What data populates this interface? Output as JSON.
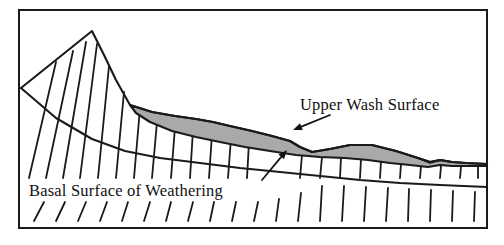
{
  "figure": {
    "name": "geological-cross-section",
    "background_color": "#ffffff",
    "frame": {
      "stroke_color": "#1a1a1a",
      "stroke_width": 2,
      "x": 19,
      "y": 10,
      "width": 468,
      "height": 218
    }
  },
  "labels": {
    "upper_wash_surface": {
      "text": "Upper Wash Surface",
      "x": 300,
      "y": 110,
      "anchor": "start",
      "color": "#111111"
    },
    "basal_surface_of_weathering": {
      "text": "Basal Surface of Weathering",
      "x": 29,
      "y": 196,
      "anchor": "start",
      "color": "#111111"
    }
  },
  "leader_arrows": [
    {
      "name": "upper-wash-surface-arrow",
      "from_x": 330,
      "from_y": 115,
      "to_x": 293,
      "to_y": 130,
      "color": "#111111"
    },
    {
      "name": "basal-surface-arrow",
      "from_x": 262,
      "from_y": 180,
      "to_x": 287,
      "to_y": 150,
      "color": "#111111"
    }
  ],
  "surfaces": {
    "ground_profile": {
      "name": "topographic-ground-surface",
      "stroke_color": "#1a1a1a",
      "stroke_width": 2.1,
      "points": "21,88 92,31 104,55 116,80 130,105 152,112 175,116 196,119 213,122 230,126 252,131 272,136 290,141 300,147 312,152 330,149 350,145 372,145 396,151 418,158 430,162 440,160 452,162 466,163 487,164"
    },
    "basal_surface": {
      "name": "basal-surface-of-weathering-line",
      "stroke_color": "#1a1a1a",
      "stroke_width": 2.1,
      "points": "21,88 56,118 92,139 125,151 160,158 200,163 240,168 280,172 320,176 360,180 400,183 440,185 487,187"
    },
    "wash_deposit": {
      "name": "upper-wash-surface-deposit",
      "fill_color": "#a9a9a9",
      "stroke_color": "#1a1a1a",
      "stroke_width": 2.1,
      "outline": "130,105 152,112 175,116 196,119 213,122 230,126 252,131 272,136 290,141 300,147 312,152 330,149 350,145 372,145 396,151 418,158 430,162 440,160 452,162 466,163 487,164 487,166 452,166 440,165 428,167 410,165 390,163 368,160 345,158 320,157 296,155 270,151 245,147 220,142 196,137 172,131 150,122 136,113"
    },
    "notch": {
      "name": "right-edge-notch",
      "stroke_color": "#1a1a1a",
      "stroke_width": 1.6,
      "points": "418,158 430,163 441,160 452,162"
    }
  },
  "hatching": {
    "name": "regolith-hatch-pattern",
    "stroke_color": "#1a1a1a",
    "stroke_width": 1.8,
    "description": "Near-vertical lines leaning right at the top, marking the weathered mantle between the ground surface and the basal surface of weathering",
    "upper_lines": [
      {
        "x1": 29,
        "y1": 178,
        "x2": 56,
        "y2": 62
      },
      {
        "x1": 46,
        "y1": 178,
        "x2": 73,
        "y2": 51
      },
      {
        "x1": 63,
        "y1": 178,
        "x2": 86,
        "y2": 42
      },
      {
        "x1": 80,
        "y1": 178,
        "x2": 97,
        "y2": 44
      },
      {
        "x1": 98,
        "y1": 178,
        "x2": 109,
        "y2": 66
      },
      {
        "x1": 116,
        "y1": 178,
        "x2": 124,
        "y2": 92
      },
      {
        "x1": 134,
        "y1": 178,
        "x2": 140,
        "y2": 108
      },
      {
        "x1": 152,
        "y1": 178,
        "x2": 157,
        "y2": 122
      },
      {
        "x1": 171,
        "y1": 178,
        "x2": 175,
        "y2": 127
      },
      {
        "x1": 190,
        "y1": 178,
        "x2": 193,
        "y2": 130
      },
      {
        "x1": 209,
        "y1": 178,
        "x2": 212,
        "y2": 134
      },
      {
        "x1": 228,
        "y1": 178,
        "x2": 231,
        "y2": 138
      },
      {
        "x1": 247,
        "y1": 178,
        "x2": 249,
        "y2": 142
      }
    ],
    "upper_lines_right": [
      {
        "x1": 300,
        "y1": 178,
        "x2": 302,
        "y2": 155
      },
      {
        "x1": 320,
        "y1": 178,
        "x2": 322,
        "y2": 157
      },
      {
        "x1": 340,
        "y1": 178,
        "x2": 341,
        "y2": 157
      },
      {
        "x1": 360,
        "y1": 178,
        "x2": 361,
        "y2": 159
      },
      {
        "x1": 380,
        "y1": 178,
        "x2": 381,
        "y2": 161
      },
      {
        "x1": 400,
        "y1": 178,
        "x2": 401,
        "y2": 164
      },
      {
        "x1": 420,
        "y1": 178,
        "x2": 421,
        "y2": 166
      },
      {
        "x1": 440,
        "y1": 178,
        "x2": 441,
        "y2": 166
      },
      {
        "x1": 460,
        "y1": 178,
        "x2": 461,
        "y2": 167
      },
      {
        "x1": 478,
        "y1": 178,
        "x2": 478,
        "y2": 167
      }
    ],
    "lower_lines": [
      {
        "x1": 34,
        "y1": 221,
        "x2": 44,
        "y2": 202
      },
      {
        "x1": 56,
        "y1": 221,
        "x2": 65,
        "y2": 202
      },
      {
        "x1": 78,
        "y1": 221,
        "x2": 86,
        "y2": 202
      },
      {
        "x1": 100,
        "y1": 221,
        "x2": 107,
        "y2": 202
      },
      {
        "x1": 122,
        "y1": 221,
        "x2": 128,
        "y2": 202
      },
      {
        "x1": 144,
        "y1": 221,
        "x2": 150,
        "y2": 202
      },
      {
        "x1": 166,
        "y1": 221,
        "x2": 171,
        "y2": 202
      },
      {
        "x1": 188,
        "y1": 221,
        "x2": 193,
        "y2": 202
      },
      {
        "x1": 210,
        "y1": 221,
        "x2": 214,
        "y2": 202
      },
      {
        "x1": 232,
        "y1": 221,
        "x2": 236,
        "y2": 202
      },
      {
        "x1": 254,
        "y1": 221,
        "x2": 258,
        "y2": 202
      },
      {
        "x1": 276,
        "y1": 221,
        "x2": 279,
        "y2": 199
      },
      {
        "x1": 298,
        "y1": 221,
        "x2": 301,
        "y2": 193
      },
      {
        "x1": 320,
        "y1": 221,
        "x2": 322,
        "y2": 186
      },
      {
        "x1": 342,
        "y1": 221,
        "x2": 344,
        "y2": 186
      },
      {
        "x1": 364,
        "y1": 221,
        "x2": 366,
        "y2": 187
      },
      {
        "x1": 386,
        "y1": 221,
        "x2": 388,
        "y2": 188
      },
      {
        "x1": 408,
        "y1": 221,
        "x2": 409,
        "y2": 189
      },
      {
        "x1": 430,
        "y1": 221,
        "x2": 431,
        "y2": 190
      },
      {
        "x1": 452,
        "y1": 221,
        "x2": 453,
        "y2": 191
      },
      {
        "x1": 474,
        "y1": 221,
        "x2": 475,
        "y2": 192
      }
    ]
  }
}
